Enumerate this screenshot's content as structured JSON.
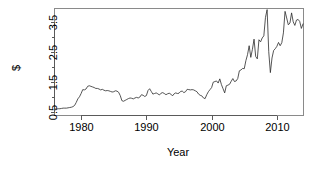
{
  "chart_data": {
    "type": "line",
    "title": "",
    "subtitle": "",
    "xlabel": "Year",
    "ylabel": "$",
    "xlim": [
      1976.0,
      2014.0
    ],
    "ylim": [
      0.4,
      3.95
    ],
    "xticks": [
      1980,
      1990,
      2000,
      2010
    ],
    "xtick_labels": [
      "1980",
      "1990",
      "2000",
      "2010"
    ],
    "yticks": [
      0.5,
      1.5,
      2.5,
      3.5
    ],
    "ytick_labels": [
      "0.5",
      "1.5",
      "2.5",
      "3.5"
    ],
    "yminorticks": [
      1.0,
      2.0,
      3.0
    ],
    "grid": false,
    "legend": false,
    "series": [
      {
        "name": "Gas price",
        "color": "#2b2b2b",
        "x": [
          1976.0,
          1976.25,
          1976.5,
          1976.75,
          1977.0,
          1977.25,
          1977.5,
          1977.75,
          1978.0,
          1978.25,
          1978.5,
          1978.75,
          1979.0,
          1979.25,
          1979.5,
          1979.75,
          1980.0,
          1980.25,
          1980.5,
          1980.75,
          1981.0,
          1981.25,
          1981.5,
          1981.75,
          1982.0,
          1982.25,
          1982.5,
          1982.75,
          1983.0,
          1983.25,
          1983.5,
          1983.75,
          1984.0,
          1984.25,
          1984.5,
          1984.75,
          1985.0,
          1985.25,
          1985.5,
          1985.75,
          1986.0,
          1986.25,
          1986.5,
          1986.75,
          1987.0,
          1987.25,
          1987.5,
          1987.75,
          1988.0,
          1988.25,
          1988.5,
          1988.75,
          1989.0,
          1989.25,
          1989.5,
          1989.75,
          1990.0,
          1990.25,
          1990.5,
          1990.75,
          1991.0,
          1991.25,
          1991.5,
          1991.75,
          1992.0,
          1992.25,
          1992.5,
          1992.75,
          1993.0,
          1993.25,
          1993.5,
          1993.75,
          1994.0,
          1994.25,
          1994.5,
          1994.75,
          1995.0,
          1995.25,
          1995.5,
          1995.75,
          1996.0,
          1996.25,
          1996.5,
          1996.75,
          1997.0,
          1997.25,
          1997.5,
          1997.75,
          1998.0,
          1998.25,
          1998.5,
          1998.75,
          1999.0,
          1999.25,
          1999.5,
          1999.75,
          2000.0,
          2000.25,
          2000.5,
          2000.75,
          2001.0,
          2001.25,
          2001.5,
          2001.75,
          2002.0,
          2002.25,
          2002.5,
          2002.75,
          2003.0,
          2003.25,
          2003.5,
          2003.75,
          2004.0,
          2004.25,
          2004.5,
          2004.75,
          2005.0,
          2005.25,
          2005.5,
          2005.75,
          2006.0,
          2006.25,
          2006.5,
          2006.75,
          2007.0,
          2007.25,
          2007.5,
          2007.75,
          2008.0,
          2008.25,
          2008.5,
          2008.75,
          2009.0,
          2009.25,
          2009.5,
          2009.75,
          2010.0,
          2010.25,
          2010.5,
          2010.75,
          2011.0,
          2011.25,
          2011.5,
          2011.75,
          2012.0,
          2012.25,
          2012.5,
          2012.75,
          2013.0,
          2013.25,
          2013.5,
          2013.75,
          2014.0
        ],
        "y": [
          0.6,
          0.6,
          0.61,
          0.61,
          0.62,
          0.63,
          0.63,
          0.63,
          0.64,
          0.65,
          0.66,
          0.68,
          0.72,
          0.82,
          0.94,
          1.01,
          1.12,
          1.25,
          1.24,
          1.27,
          1.36,
          1.38,
          1.36,
          1.34,
          1.32,
          1.29,
          1.29,
          1.27,
          1.24,
          1.26,
          1.23,
          1.21,
          1.22,
          1.21,
          1.19,
          1.17,
          1.18,
          1.21,
          1.2,
          1.16,
          1.05,
          0.88,
          0.86,
          0.89,
          0.92,
          0.95,
          0.97,
          0.96,
          0.94,
          0.97,
          0.99,
          0.97,
          1.0,
          1.08,
          1.06,
          1.02,
          1.05,
          1.22,
          1.28,
          1.19,
          1.1,
          1.12,
          1.14,
          1.11,
          1.07,
          1.13,
          1.15,
          1.12,
          1.08,
          1.11,
          1.13,
          1.1,
          1.04,
          1.11,
          1.14,
          1.12,
          1.13,
          1.19,
          1.2,
          1.15,
          1.18,
          1.26,
          1.25,
          1.24,
          1.25,
          1.24,
          1.21,
          1.18,
          1.1,
          1.06,
          1.04,
          0.97,
          0.95,
          1.08,
          1.18,
          1.25,
          1.32,
          1.5,
          1.52,
          1.54,
          1.47,
          1.61,
          1.42,
          1.28,
          1.14,
          1.38,
          1.4,
          1.43,
          1.53,
          1.62,
          1.52,
          1.54,
          1.62,
          1.88,
          1.91,
          1.96,
          1.95,
          2.22,
          2.42,
          2.72,
          2.33,
          2.6,
          2.94,
          2.36,
          2.28,
          2.92,
          2.85,
          2.98,
          3.05,
          3.67,
          3.93,
          2.52,
          1.82,
          2.31,
          2.56,
          2.62,
          2.7,
          2.83,
          2.72,
          2.82,
          3.15,
          3.87,
          3.65,
          3.42,
          3.48,
          3.82,
          3.52,
          3.4,
          3.58,
          3.6,
          3.53,
          3.3,
          3.45
        ]
      }
    ]
  },
  "axes": {
    "ylabel": "$",
    "xlabel": "Year",
    "ytick_labels": [
      "0.5",
      "1.5",
      "2.5",
      "3.5"
    ],
    "xtick_labels": [
      "1980",
      "1990",
      "2000",
      "2010"
    ]
  }
}
